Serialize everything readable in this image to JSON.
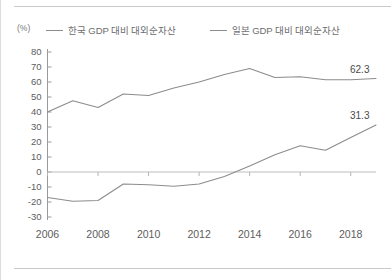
{
  "unit": "(%)",
  "legend": {
    "position": "top",
    "entries": [
      {
        "icon": "line-swatch-icon",
        "label": "한국 GDP 대비 대외순자산"
      },
      {
        "icon": "line-swatch-icon",
        "label": "일본 GDP 대비 대외순자산"
      }
    ]
  },
  "end_labels": [
    {
      "name": "japan-end-value",
      "text": "62.3"
    },
    {
      "name": "korea-end-value",
      "text": "31.3"
    }
  ],
  "chart_data": {
    "type": "line",
    "title": "",
    "subtitle": "",
    "xlabel": "",
    "ylabel": "(%)",
    "xlim": [
      2006,
      2019
    ],
    "ylim": [
      -30,
      80
    ],
    "ytick_step": 10,
    "xtick_step": 2,
    "grid": false,
    "zero_line": true,
    "legend_position": "top",
    "yticks": [
      80,
      70,
      60,
      50,
      40,
      30,
      20,
      10,
      0,
      -10,
      -20,
      -30
    ],
    "ytick_labels": [
      "80",
      "70",
      "60",
      "50",
      "40",
      "30",
      "20",
      "10",
      "0",
      "-10",
      "-20",
      "-30"
    ],
    "xticks": [
      2006,
      2008,
      2010,
      2012,
      2014,
      2016,
      2018
    ],
    "xtick_labels": [
      "2006",
      "2008",
      "2010",
      "2012",
      "2014",
      "2016",
      "2018"
    ],
    "x": [
      2006,
      2007,
      2008,
      2009,
      2010,
      2011,
      2012,
      2013,
      2014,
      2015,
      2016,
      2017,
      2018,
      2019
    ],
    "series": [
      {
        "name": "일본 GDP 대비 대외순자산",
        "color": "#8c8c8c",
        "values": [
          40.0,
          47.5,
          43.0,
          52.0,
          51.0,
          56.0,
          60.0,
          65.0,
          69.0,
          63.0,
          63.5,
          61.5,
          61.5,
          62.3
        ],
        "end_label": "62.3"
      },
      {
        "name": "한국 GDP 대비 대외순자산",
        "color": "#8c8c8c",
        "values": [
          -17.0,
          -19.5,
          -19.0,
          -8.0,
          -8.5,
          -9.5,
          -8.0,
          -3.0,
          4.0,
          11.5,
          17.5,
          14.5,
          23.0,
          31.3
        ],
        "end_label": "31.3"
      }
    ],
    "annotations": [
      {
        "text": "62.3",
        "series": "일본 GDP 대비 대외순자산",
        "x": 2019,
        "y": 62.3
      },
      {
        "text": "31.3",
        "series": "한국 GDP 대비 대외순자산",
        "x": 2019,
        "y": 31.3
      }
    ]
  }
}
